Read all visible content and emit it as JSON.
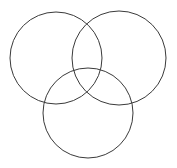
{
  "figure": {
    "name": "three-circle-venn-diagram",
    "type": "venn-diagram",
    "width": 177,
    "height": 168,
    "background_color": "#ffffff",
    "stroke_color": "#3a3a3a",
    "stroke_width": 1,
    "fill": "none",
    "circle_count": 3,
    "title": "",
    "caption": "",
    "labels": []
  },
  "circles": [
    {
      "id": "top-left-circle",
      "position": "top-left",
      "cx": 56,
      "cy": 58,
      "r": 46,
      "stroke_color": "#3a3a3a",
      "fill": "none",
      "label": ""
    },
    {
      "id": "top-right-circle",
      "position": "top-right",
      "cx": 119,
      "cy": 58,
      "r": 47,
      "stroke_color": "#3a3a3a",
      "fill": "none",
      "label": ""
    },
    {
      "id": "bottom-center-circle",
      "position": "bottom-center",
      "cx": 88,
      "cy": 113,
      "r": 45,
      "stroke_color": "#3a3a3a",
      "fill": "none",
      "label": ""
    }
  ]
}
